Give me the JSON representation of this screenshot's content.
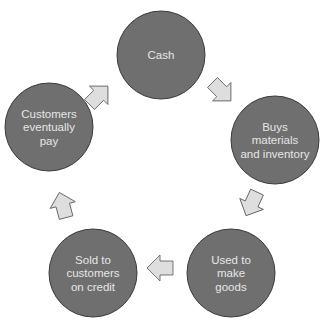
{
  "diagram": {
    "type": "cycle",
    "colors": {
      "node_fill": "#6f6f6f",
      "node_stroke": "#3a3a3a",
      "node_text": "#e6e6e6",
      "arrow_fill": "#dedede",
      "arrow_stroke": "#555555",
      "background": "#ffffff"
    },
    "nodes": [
      {
        "id": "cash",
        "lines": [
          "Cash"
        ],
        "cx": 161,
        "cy": 55
      },
      {
        "id": "buys",
        "lines": [
          "Buys",
          "materials",
          "and inventory"
        ],
        "cx": 275,
        "cy": 140
      },
      {
        "id": "used",
        "lines": [
          "Used to",
          "make",
          "goods"
        ],
        "cx": 231,
        "cy": 273
      },
      {
        "id": "sold",
        "lines": [
          "Sold to",
          "customers",
          "on credit"
        ],
        "cx": 93,
        "cy": 273
      },
      {
        "id": "pay",
        "lines": [
          "Customers",
          "eventually",
          "pay"
        ],
        "cx": 49,
        "cy": 127
      }
    ],
    "arrows": [
      {
        "from": "cash",
        "to": "buys",
        "cx": 221,
        "cy": 91,
        "angle": 45
      },
      {
        "from": "buys",
        "to": "used",
        "cx": 252,
        "cy": 203,
        "angle": 115
      },
      {
        "from": "used",
        "to": "sold",
        "cx": 161,
        "cy": 268,
        "angle": 180
      },
      {
        "from": "sold",
        "to": "pay",
        "cx": 63,
        "cy": 206,
        "angle": -105
      },
      {
        "from": "pay",
        "to": "cash",
        "cx": 98,
        "cy": 96,
        "angle": -45
      }
    ]
  }
}
